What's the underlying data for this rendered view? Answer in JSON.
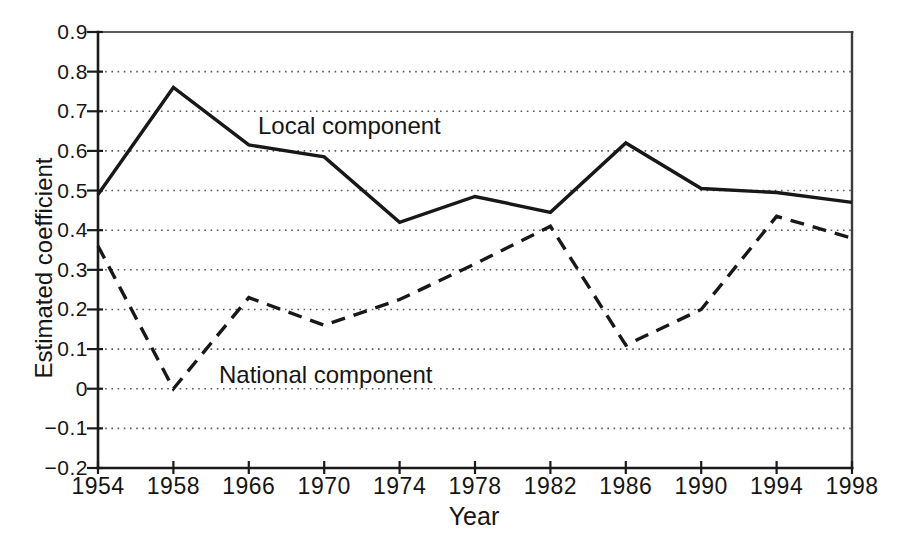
{
  "chart_data": {
    "type": "line",
    "title": "",
    "xlabel": "Year",
    "ylabel": "Estimated coefficient",
    "categories": [
      "1954",
      "1958",
      "1966",
      "1970",
      "1974",
      "1978",
      "1982",
      "1986",
      "1990",
      "1994",
      "1998"
    ],
    "y_ticks": [
      "0.9",
      "0.8",
      "0.7",
      "0.6",
      "0.5",
      "0.4",
      "0.3",
      "0.2",
      "0.1",
      "0",
      "−0.1",
      "−0.2"
    ],
    "ylim": [
      -0.2,
      0.9
    ],
    "grid": "horizontal dotted lines at every 0.1 from -0.1 to 0.8",
    "legend_position": "inline text annotations next to lines",
    "series": [
      {
        "name": "Local component",
        "style": "solid",
        "values": [
          0.49,
          0.76,
          0.615,
          0.585,
          0.42,
          0.485,
          0.445,
          0.62,
          0.505,
          0.495,
          0.47
        ]
      },
      {
        "name": "National component",
        "style": "dashed",
        "values": [
          0.36,
          0.0,
          0.23,
          0.16,
          0.225,
          0.315,
          0.41,
          0.11,
          0.2,
          0.435,
          0.38
        ]
      }
    ],
    "annotations": [
      {
        "text": "Local component",
        "series": "local"
      },
      {
        "text": "National component",
        "series": "national"
      }
    ]
  },
  "colors": {
    "line": "#181818",
    "grid_dots": "#5a5a5a",
    "frame_top": "#5c5c5c",
    "frame_right": "#3c3c3c",
    "axis": "#1a1a1a",
    "background": "#ffffff",
    "text": "#151515"
  }
}
